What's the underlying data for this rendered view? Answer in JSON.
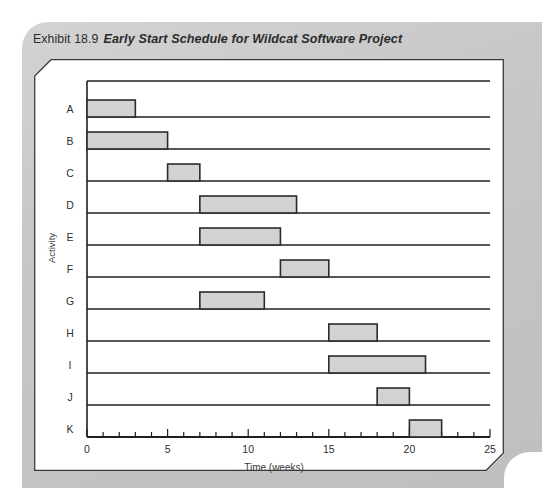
{
  "exhibit": {
    "number": "Exhibit 18.9",
    "caption": "Early Start Schedule for Wildcat Software Project"
  },
  "colors": {
    "panel_bg": "#c9c9c9",
    "chart_bg": "#ffffff",
    "bar_fill": "#d2d2d2",
    "bar_stroke": "#2b2b2b",
    "grid": "#1f1f1f",
    "axis": "#1f1f1f",
    "text": "#2f2f2f"
  },
  "chart_data": {
    "type": "bar",
    "orientation": "horizontal",
    "subtype": "gantt",
    "title": "Early Start Schedule for Wildcat Software Project",
    "xlabel": "Time (weeks)",
    "ylabel": "Activity",
    "xlim": [
      0,
      25
    ],
    "ylim": [
      0,
      11
    ],
    "grid": true,
    "legend": null,
    "xticks": [
      0,
      5,
      10,
      15,
      20,
      25
    ],
    "xtick_labels": [
      "0",
      "5",
      "10",
      "15",
      "20",
      "25"
    ],
    "xminor_step": 1,
    "categories": [
      "A",
      "B",
      "C",
      "D",
      "E",
      "F",
      "G",
      "H",
      "I",
      "J",
      "K"
    ],
    "bars": [
      {
        "activity": "A",
        "start": 0,
        "finish": 3,
        "duration": 3
      },
      {
        "activity": "B",
        "start": 0,
        "finish": 5,
        "duration": 5
      },
      {
        "activity": "C",
        "start": 5,
        "finish": 7,
        "duration": 2
      },
      {
        "activity": "D",
        "start": 7,
        "finish": 13,
        "duration": 6
      },
      {
        "activity": "E",
        "start": 7,
        "finish": 12,
        "duration": 5
      },
      {
        "activity": "F",
        "start": 12,
        "finish": 15,
        "duration": 3
      },
      {
        "activity": "G",
        "start": 7,
        "finish": 11,
        "duration": 4
      },
      {
        "activity": "H",
        "start": 15,
        "finish": 18,
        "duration": 3
      },
      {
        "activity": "I",
        "start": 15,
        "finish": 21,
        "duration": 6
      },
      {
        "activity": "J",
        "start": 18,
        "finish": 20,
        "duration": 2
      },
      {
        "activity": "K",
        "start": 20,
        "finish": 22,
        "duration": 2
      }
    ]
  }
}
